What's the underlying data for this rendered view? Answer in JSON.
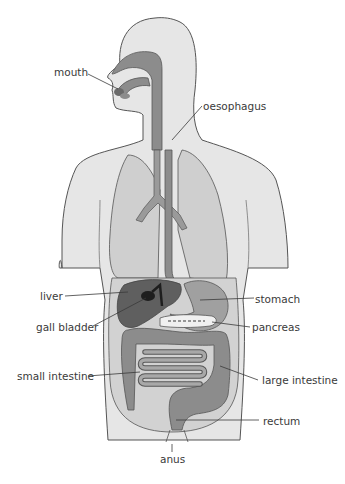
{
  "diagram": {
    "title": "",
    "labels": {
      "mouth": "mouth",
      "oesophagus": "oesophagus",
      "liver": "liver",
      "gall_bladder": "gall bladder",
      "stomach": "stomach",
      "pancreas": "pancreas",
      "small_intestine": "small intestine",
      "large_intestine": "large intestine",
      "rectum": "rectum",
      "anus": "anus"
    },
    "colors": {
      "body": "#e6e6e6",
      "outline": "#555555",
      "tract": "#8c8c8c",
      "lungs": "#cfcfcf",
      "liver": "#5f5f5f",
      "gall_bladder": "#1e1e1e",
      "stomach": "#a0a0a0",
      "abdomen": "#d2d2d2",
      "label_text": "#3a3a3a",
      "leader_line": "#3a3a3a"
    }
  }
}
